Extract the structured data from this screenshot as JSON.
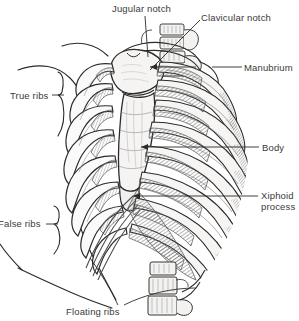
{
  "figure": {
    "background_color": "#ffffff",
    "ink_color": "#2b2b2b",
    "label_color": "#3a3a3a",
    "bone_fill": "#f4f3f1",
    "shadow_fill": "#8e8e8e"
  },
  "labels": {
    "jugular_notch": "Jugular notch",
    "clavicular_notch": "Clavicular notch",
    "manubrium": "Manubrium",
    "body": "Body",
    "xiphoid_process": "Xiphoid process",
    "true_ribs": "True ribs",
    "false_ribs": "False ribs",
    "floating_ribs": "Floating ribs"
  },
  "annotations": [
    {
      "name": "jugular-notch",
      "text": "Jugular notch",
      "side": "top",
      "leader": "vertical-line",
      "target": "superior border of manubrium"
    },
    {
      "name": "clavicular-notch",
      "text": "Clavicular notch",
      "side": "top-right",
      "leader": "diagonal-line",
      "target": "clavicular notch of manubrium"
    },
    {
      "name": "manubrium",
      "text": "Manubrium",
      "side": "right",
      "leader": "horizontal-line",
      "target": "manubrium of sternum"
    },
    {
      "name": "body",
      "text": "Body",
      "side": "right",
      "leader": "horizontal-line",
      "target": "body of sternum"
    },
    {
      "name": "xiphoid-process",
      "text": "Xiphoid process",
      "side": "right",
      "leader": "horizontal-line",
      "target": "xiphoid process"
    },
    {
      "name": "true-ribs",
      "text": "True ribs",
      "side": "left",
      "leader": "curly-brace",
      "target": "ribs 1-7"
    },
    {
      "name": "false-ribs",
      "text": "False ribs",
      "side": "left",
      "leader": "curly-brace",
      "target": "ribs 8-12"
    },
    {
      "name": "floating-ribs",
      "text": "Floating ribs",
      "side": "bottom",
      "leader": "two-lines",
      "target": "ribs 11-12"
    }
  ]
}
